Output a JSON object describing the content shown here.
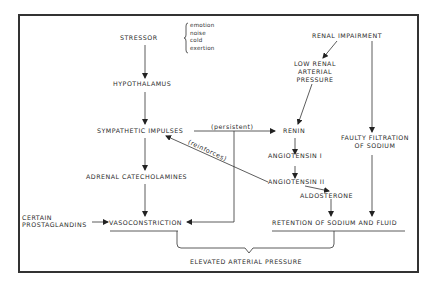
{
  "diagram": {
    "nodes": {
      "stressor": "STRESSOR",
      "stressor_types": [
        "emotion",
        "noise",
        "cold",
        "exertion"
      ],
      "hypothalamus": "HYPOTHALAMUS",
      "sympathetic_impulses": "SYMPATHETIC IMPULSES",
      "adrenal_catecholamines": "ADRENAL CATECHOLAMINES",
      "certain_prostaglandins": [
        "CERTAIN",
        "PROSTAGLANDINS"
      ],
      "vasoconstriction": "VASOCONSTRICTION",
      "renal_impairment": "RENAL IMPAIRMENT",
      "low_renal_arterial_pressure": [
        "LOW RENAL",
        "ARTERIAL",
        "PRESSURE"
      ],
      "renin": "RENIN",
      "angiotensin_1": "ANGIOTENSIN I",
      "angiotensin_2": "ANGIOTENSIN II",
      "aldosterone": "ALDOSTERONE",
      "faulty_filtration": [
        "FAULTY FILTRATION",
        "OF SODIUM"
      ],
      "retention": "RETENTION OF SODIUM AND FLUID",
      "elevated_pressure": "ELEVATED ARTERIAL PRESSURE"
    },
    "edge_labels": {
      "persistent": "(persistent)",
      "reinforces": "(reinforces)"
    },
    "edges": [
      {
        "from": "stressor",
        "to": "hypothalamus"
      },
      {
        "from": "hypothalamus",
        "to": "sympathetic_impulses"
      },
      {
        "from": "sympathetic_impulses",
        "to": "adrenal_catecholamines"
      },
      {
        "from": "adrenal_catecholamines",
        "to": "vasoconstriction"
      },
      {
        "from": "certain_prostaglandins",
        "to": "vasoconstriction"
      },
      {
        "from": "sympathetic_impulses",
        "to": "renin",
        "label": "(persistent)"
      },
      {
        "from": "sympathetic_impulses",
        "to": "vasoconstriction",
        "label": "(persistent)"
      },
      {
        "from": "renal_impairment",
        "to": "low_renal_arterial_pressure"
      },
      {
        "from": "renal_impairment",
        "to": "faulty_filtration"
      },
      {
        "from": "low_renal_arterial_pressure",
        "to": "renin"
      },
      {
        "from": "renin",
        "to": "angiotensin_1"
      },
      {
        "from": "angiotensin_1",
        "to": "angiotensin_2"
      },
      {
        "from": "angiotensin_2",
        "to": "sympathetic_impulses",
        "label": "(reinforces)"
      },
      {
        "from": "angiotensin_2",
        "to": "aldosterone"
      },
      {
        "from": "aldosterone",
        "to": "retention"
      },
      {
        "from": "faulty_filtration",
        "to": "retention"
      },
      {
        "from": "vasoconstriction",
        "to": "elevated_pressure"
      },
      {
        "from": "retention",
        "to": "elevated_pressure"
      }
    ]
  }
}
